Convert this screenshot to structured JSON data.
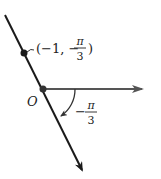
{
  "diagram": {
    "type": "polar-coordinate-plot",
    "origin_label": "O",
    "point": {
      "label_prefix": "(−1, −",
      "label_suffix": ")",
      "fraction_num": "π",
      "fraction_den": "3",
      "r": -1,
      "theta": "-π/3"
    },
    "angle": {
      "sign": "−",
      "fraction_num": "π",
      "fraction_den": "3",
      "value": "-π/3"
    },
    "colors": {
      "line": "#1a1a1a",
      "polar_axis": "#555555",
      "text": "#222222"
    }
  }
}
